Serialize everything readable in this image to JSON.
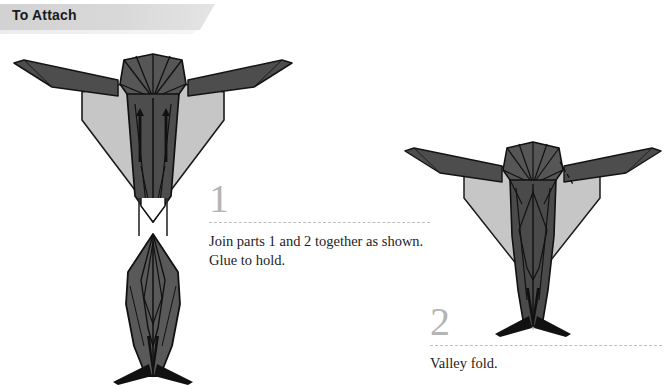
{
  "page": {
    "background_color": "#ffffff",
    "banner": {
      "title": "To Attach",
      "color": "#d6d6d6"
    }
  },
  "steps": [
    {
      "number": "1",
      "text": "Join parts 1 and 2 together as shown. Glue to hold.",
      "number_color": "#b4b4b4",
      "rule_color": "#bdbdbd"
    },
    {
      "number": "2",
      "text": "Valley fold.",
      "number_color": "#b4b4b4",
      "rule_color": "#bdbdbd"
    }
  ],
  "figures": [
    {
      "name": "figure-left-exploded",
      "caption_step": "1",
      "parts": [
        {
          "label": "part-1-wings-and-head",
          "fill": "#4d4d4d"
        },
        {
          "label": "part-1-kite-skirt",
          "fill": "#c6c6c6"
        },
        {
          "label": "part-2-body",
          "fill": "#4d4d4d"
        },
        {
          "label": "assembly-arrows",
          "fill": "#111111"
        },
        {
          "label": "alignment-guide-lines",
          "fill": "#2b2b2b"
        }
      ]
    },
    {
      "name": "figure-right-assembled",
      "caption_step": "2",
      "parts": [
        {
          "label": "wings",
          "fill": "#4d4d4d"
        },
        {
          "label": "head-fan",
          "fill": "#4d4d4d"
        },
        {
          "label": "kite-skirt",
          "fill": "#c6c6c6"
        },
        {
          "label": "body",
          "fill": "#444444"
        },
        {
          "label": "legs",
          "fill": "#111111"
        },
        {
          "label": "valley-fold-dashed-line",
          "fill": "#111111"
        }
      ]
    }
  ],
  "colors": {
    "dark_gray": "#4d4d4d",
    "light_gray": "#c6c6c6",
    "mid_gray": "#5a5a5a",
    "outline": "#111111",
    "number_gray": "#b4b4b4",
    "text_black": "#1d1d1d"
  }
}
